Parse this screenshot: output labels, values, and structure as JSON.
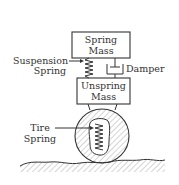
{
  "diagram": {
    "components": {
      "spring_mass": {
        "line1": "Spring",
        "line2": "Mass"
      },
      "unspring_mass": {
        "line1": "Unspring",
        "line2": "Mass"
      },
      "suspension_spring": {
        "line1": "Suspension",
        "line2": "Spring"
      },
      "damper": {
        "label": "Damper"
      },
      "tire_spring": {
        "line1": "Tire",
        "line2": "Spring"
      }
    },
    "colors": {
      "ink": "#333333",
      "background": "#ffffff"
    }
  }
}
